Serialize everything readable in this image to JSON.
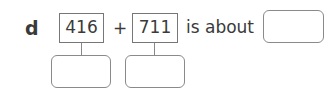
{
  "question": {
    "label": "d",
    "operand1": "416",
    "operator": "+",
    "operand2": "711",
    "phrase": "is about",
    "answer_value": "",
    "rounded1_value": "",
    "rounded2_value": ""
  }
}
